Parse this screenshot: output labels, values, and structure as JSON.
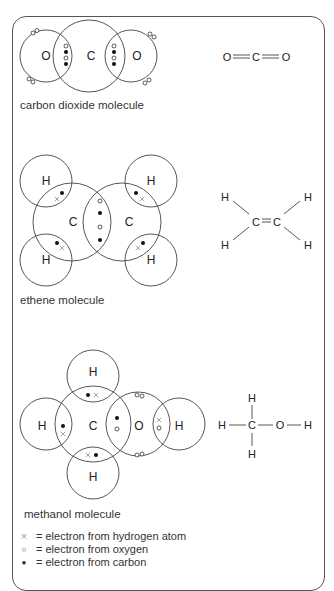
{
  "colors": {
    "line": "#444444",
    "text": "#2a2a2a",
    "hydrogen_cross": "#9a9a9a",
    "background": "#ffffff"
  },
  "molecules": [
    {
      "id": "carbon-dioxide",
      "caption": "carbon dioxide molecule",
      "atoms": [
        "O",
        "C",
        "O"
      ],
      "structural_formula": {
        "atoms": [
          "O",
          "C",
          "O"
        ],
        "bonds": [
          "double",
          "double"
        ],
        "text": "O=C=O"
      }
    },
    {
      "id": "ethene",
      "caption": "ethene molecule",
      "atoms": [
        "H",
        "H",
        "C",
        "C",
        "H",
        "H"
      ],
      "structural_formula": {
        "atoms": [
          "H",
          "H",
          "C",
          "C",
          "H",
          "H"
        ],
        "bonds": [
          "single",
          "single",
          "double",
          "single",
          "single"
        ]
      }
    },
    {
      "id": "methanol",
      "caption": "methanol molecule",
      "atoms": [
        "H",
        "H",
        "C",
        "O",
        "H",
        "H"
      ],
      "structural_formula": {
        "atoms": [
          "H",
          "H",
          "C",
          "O",
          "H",
          "H"
        ],
        "bonds": [
          "single",
          "single",
          "single",
          "single",
          "single"
        ]
      }
    }
  ],
  "legend": [
    {
      "symbol": "cross-icon",
      "glyph": "×",
      "text": "= electron from hydrogen atom"
    },
    {
      "symbol": "open-circle-icon",
      "glyph": "○",
      "text": "= electron from oxygen"
    },
    {
      "symbol": "filled-dot-icon",
      "glyph": "●",
      "text": "= electron from carbon"
    }
  ],
  "atom_labels": {
    "O": "O",
    "C": "C",
    "H": "H"
  }
}
